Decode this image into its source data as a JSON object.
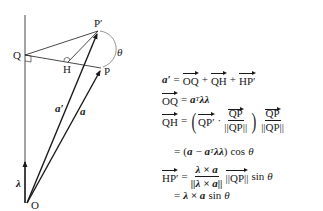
{
  "diagram": {
    "points": {
      "O": {
        "label": "O",
        "x": 27,
        "y": 203
      },
      "Q": {
        "label": "Q",
        "x": 25,
        "y": 55
      },
      "H": {
        "label": "H",
        "x": 68,
        "y": 62
      },
      "P_prime": {
        "label": "P′",
        "x": 98,
        "y": 31
      },
      "P": {
        "label": "P",
        "x": 101,
        "y": 68
      }
    },
    "vector_labels": {
      "a_prime": "a′",
      "a": "a",
      "lambda": "λ"
    },
    "angle_label": "θ",
    "colors": {
      "stroke": "#1a1a1a",
      "arc": "#777777"
    }
  },
  "equations": {
    "eq1": {
      "lhs": "a′",
      "eq": "=",
      "t1": "OQ",
      "plus1": "+",
      "t2": "QH",
      "plus2": "+",
      "t3": "HP′"
    },
    "eq2": {
      "lhs": "OQ",
      "eq": "=",
      "a": "a",
      "T": "T",
      "ll": "λλ"
    },
    "eq3": {
      "lhs": "QH",
      "eq": "=",
      "qp_prime": "QP′",
      "dot": "·",
      "num": "QP",
      "den": "||QP||",
      "num2": "QP",
      "den2": "||QP||"
    },
    "eq4": {
      "eq": "=",
      "open": "(",
      "a": "a",
      "minus": "−",
      "a2": "a",
      "T": "T",
      "ll": "λλ",
      "close": ")",
      "cos": "cos",
      "theta": "θ"
    },
    "eq5": {
      "lhs": "HP′",
      "eq": "=",
      "num": "λ × a",
      "den": "||λ × a||",
      "norm": "||QP||",
      "sin": "sin",
      "theta": "θ"
    },
    "eq6": {
      "eq": "=",
      "expr": "λ × a",
      "sin": "sin",
      "theta": "θ"
    }
  }
}
